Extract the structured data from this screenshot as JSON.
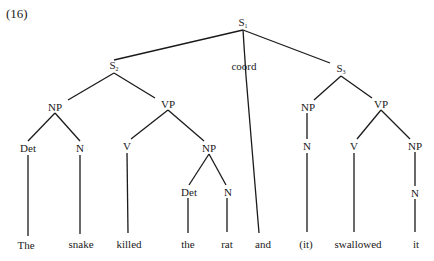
{
  "example_number": "(16)",
  "tree": {
    "nodes": [
      {
        "id": "S1",
        "label": "S",
        "sub": "1",
        "x": 243,
        "y": 24
      },
      {
        "id": "S2",
        "label": "S",
        "sub": "2",
        "x": 114,
        "y": 67
      },
      {
        "id": "coord",
        "label": "coord",
        "sub": "",
        "x": 244,
        "y": 66
      },
      {
        "id": "S3",
        "label": "S",
        "sub": "3",
        "x": 341,
        "y": 70
      },
      {
        "id": "NP1",
        "label": "NP",
        "sub": "",
        "x": 55,
        "y": 107
      },
      {
        "id": "VP1",
        "label": "VP",
        "sub": "",
        "x": 168,
        "y": 104
      },
      {
        "id": "Det1",
        "label": "Det",
        "sub": "",
        "x": 28,
        "y": 148
      },
      {
        "id": "N1",
        "label": "N",
        "sub": "",
        "x": 80,
        "y": 148
      },
      {
        "id": "V1",
        "label": "V",
        "sub": "",
        "x": 127,
        "y": 146
      },
      {
        "id": "NP2",
        "label": "NP",
        "sub": "",
        "x": 209,
        "y": 148
      },
      {
        "id": "Det2",
        "label": "Det",
        "sub": "",
        "x": 189,
        "y": 192
      },
      {
        "id": "N2",
        "label": "N",
        "sub": "",
        "x": 228,
        "y": 192
      },
      {
        "id": "NP3",
        "label": "NP",
        "sub": "",
        "x": 308,
        "y": 107
      },
      {
        "id": "VP2",
        "label": "VP",
        "sub": "",
        "x": 381,
        "y": 104
      },
      {
        "id": "N3",
        "label": "N",
        "sub": "",
        "x": 307,
        "y": 146
      },
      {
        "id": "V2",
        "label": "V",
        "sub": "",
        "x": 354,
        "y": 146
      },
      {
        "id": "NP4",
        "label": "NP",
        "sub": "",
        "x": 415,
        "y": 146
      },
      {
        "id": "N4",
        "label": "N",
        "sub": "",
        "x": 415,
        "y": 193
      }
    ],
    "leaves": [
      {
        "id": "w1",
        "label": "The",
        "x": 26,
        "y": 245,
        "parent": "Det1"
      },
      {
        "id": "w2",
        "label": "snake",
        "x": 81,
        "y": 244,
        "parent": "N1"
      },
      {
        "id": "w3",
        "label": "killed",
        "x": 129,
        "y": 244,
        "parent": "V1"
      },
      {
        "id": "w4",
        "label": "the",
        "x": 188,
        "y": 244,
        "parent": "Det2"
      },
      {
        "id": "w5",
        "label": "rat",
        "x": 227,
        "y": 244,
        "parent": "N2"
      },
      {
        "id": "w6",
        "label": "and",
        "x": 263,
        "y": 244,
        "parent": "coord"
      },
      {
        "id": "w7",
        "label": "(it)",
        "x": 306,
        "y": 244,
        "parent": "N3"
      },
      {
        "id": "w8",
        "label": "swallowed",
        "x": 358,
        "y": 244,
        "parent": "V2"
      },
      {
        "id": "w9",
        "label": "it",
        "x": 416,
        "y": 244,
        "parent": "N4"
      }
    ],
    "edges": [
      [
        243,
        30,
        114,
        60
      ],
      [
        243,
        30,
        246,
        76
      ],
      [
        243,
        30,
        330,
        63
      ],
      [
        114,
        73,
        68,
        100
      ],
      [
        114,
        73,
        155,
        98
      ],
      [
        55,
        113,
        28,
        141
      ],
      [
        55,
        113,
        80,
        141
      ],
      [
        168,
        110,
        131,
        139
      ],
      [
        168,
        110,
        204,
        141
      ],
      [
        209,
        154,
        189,
        185
      ],
      [
        209,
        154,
        226,
        185
      ],
      [
        341,
        76,
        314,
        100
      ],
      [
        341,
        76,
        372,
        98
      ],
      [
        307,
        113,
        307,
        139
      ],
      [
        381,
        110,
        357,
        139
      ],
      [
        381,
        110,
        410,
        139
      ],
      [
        415,
        152,
        415,
        186
      ],
      [
        28,
        155,
        28,
        236
      ],
      [
        80,
        155,
        80,
        234
      ],
      [
        127,
        153,
        128,
        233
      ],
      [
        188,
        198,
        188,
        233
      ],
      [
        227,
        198,
        227,
        232
      ],
      [
        246,
        76,
        259,
        233
      ],
      [
        307,
        153,
        307,
        232
      ],
      [
        354,
        153,
        354,
        232
      ],
      [
        415,
        199,
        415,
        232
      ]
    ]
  },
  "colors": {
    "ink": "#1a1a1a",
    "background": "#ffffff"
  }
}
